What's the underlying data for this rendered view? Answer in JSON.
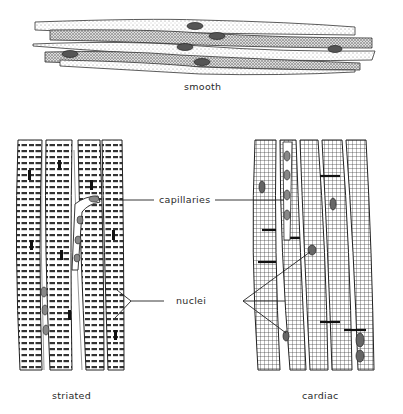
{
  "diagram": {
    "panels": [
      {
        "id": "smooth",
        "label": "smooth"
      },
      {
        "id": "striated",
        "label": "striated"
      },
      {
        "id": "cardiac",
        "label": "cardiac"
      }
    ],
    "callouts": [
      {
        "id": "capillaries",
        "label": "capillaries"
      },
      {
        "id": "nuclei",
        "label": "nuclei"
      }
    ]
  },
  "colors": {
    "ink": "#222222",
    "stipple": "#9a9a9a",
    "background": "#ffffff"
  }
}
